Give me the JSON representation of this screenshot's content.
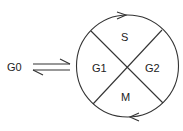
{
  "diagram": {
    "type": "cell-cycle",
    "outside_state": "G0",
    "phases": [
      {
        "id": "S",
        "label": "S",
        "position": "top"
      },
      {
        "id": "G2",
        "label": "G2",
        "position": "right"
      },
      {
        "id": "M",
        "label": "M",
        "position": "bottom"
      },
      {
        "id": "G1",
        "label": "G1",
        "position": "left"
      }
    ],
    "edges": [
      {
        "from": "G0",
        "to": "G1",
        "style": "equilibrium-arrows"
      },
      {
        "direction": "clockwise",
        "arrow_top": "right",
        "arrow_bottom": "left"
      }
    ],
    "colors": {
      "line": "#333333",
      "text": "#222222",
      "background": "#ffffff"
    }
  }
}
